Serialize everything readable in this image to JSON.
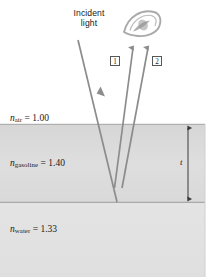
{
  "figure": {
    "type": "thin-film-interference-diagram",
    "width": 207,
    "height": 277,
    "background_color": "#ffffff"
  },
  "annotations": {
    "incident_light_line1": "Incident",
    "incident_light_line2": "light",
    "thickness_label": "t"
  },
  "rays": [
    {
      "id": "ray-1",
      "tag": "1"
    },
    {
      "id": "ray-2",
      "tag": "2"
    }
  ],
  "media": [
    {
      "id": "air",
      "symbol": "n",
      "subscript": "air",
      "equals": " = ",
      "value": "1.00",
      "color": "#ffffff"
    },
    {
      "id": "gasoline",
      "symbol": "n",
      "subscript": "gasoline",
      "equals": " = ",
      "value": "1.40",
      "color": "#dcdcdc"
    },
    {
      "id": "water",
      "symbol": "n",
      "subscript": "water",
      "equals": " = ",
      "value": "1.33",
      "color": "#e2e2e2"
    }
  ],
  "colors": {
    "ray_stroke": "#8c8c8c",
    "boundary_line": "#9a9a9a",
    "dimension_arrow": "#3a3a3a",
    "tag_border": "#575757",
    "eye_stroke": "#7d7d7d"
  }
}
